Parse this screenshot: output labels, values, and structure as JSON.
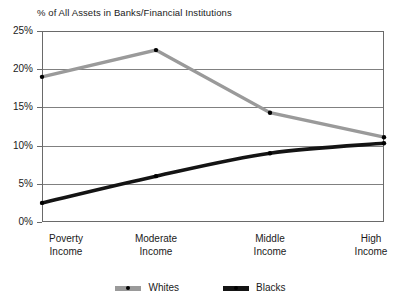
{
  "chart_data": {
    "type": "line",
    "title": "% of All Assets in Banks/Financial Institutions",
    "xlabel": "",
    "ylabel": "",
    "categories": [
      "Poverty Income",
      "Moderate Income",
      "Middle Income",
      "High Income"
    ],
    "category_lines": [
      [
        "Poverty",
        "Income"
      ],
      [
        "Moderate",
        "Income"
      ],
      [
        "Middle",
        "Income"
      ],
      [
        "High",
        "Income"
      ]
    ],
    "ylim": [
      0,
      25
    ],
    "ytick_values": [
      0,
      5,
      10,
      15,
      20,
      25
    ],
    "ytick_labels": [
      "0%",
      "5%",
      "10%",
      "15%",
      "20%",
      "25%"
    ],
    "grid": true,
    "grid_axis": "y",
    "legend_position": "bottom",
    "series": [
      {
        "name": "Whites",
        "color": "#9a9a9a",
        "marker": "circle",
        "marker_color": "#000000",
        "values": [
          19.0,
          22.5,
          14.3,
          11.1
        ]
      },
      {
        "name": "Blacks",
        "color": "#141414",
        "marker": "circle",
        "marker_color": "#000000",
        "values": [
          2.5,
          6.0,
          9.0,
          10.3
        ]
      }
    ]
  },
  "legend": {
    "items": [
      {
        "label": "Whites"
      },
      {
        "label": "Blacks"
      }
    ]
  },
  "colors": {
    "whites_line": "#9a9a9a",
    "blacks_line": "#141414",
    "gridline": "#808080",
    "frame": "#6a6a6a",
    "text": "#1a1a1a",
    "background": "#ffffff"
  }
}
